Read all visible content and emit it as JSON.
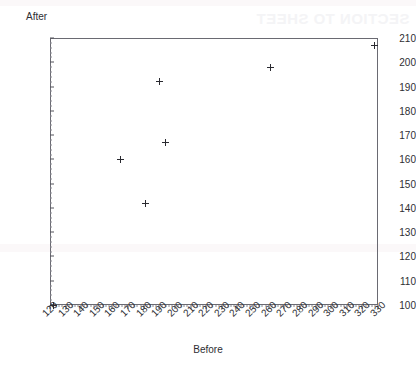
{
  "artifact": {
    "watermark_text": "SECTION TO SHEET"
  },
  "chart_data": {
    "type": "scatter",
    "title": "",
    "xlabel": "Before",
    "ylabel": "After",
    "xlim": [
      120,
      330
    ],
    "ylim": [
      100,
      210
    ],
    "x_tick_step": 10,
    "y_tick_step": 10,
    "grid": false,
    "legend": null,
    "marker": "plus",
    "marker_color": "#2a2a30",
    "x_ticks": [
      120,
      130,
      140,
      150,
      160,
      170,
      180,
      190,
      200,
      210,
      220,
      230,
      240,
      250,
      260,
      270,
      280,
      290,
      300,
      310,
      320,
      330
    ],
    "y_ticks": [
      100,
      110,
      120,
      130,
      140,
      150,
      160,
      170,
      180,
      190,
      200,
      210
    ],
    "points": [
      {
        "x": 122,
        "y": 100
      },
      {
        "x": 165,
        "y": 160
      },
      {
        "x": 181,
        "y": 142
      },
      {
        "x": 190,
        "y": 192
      },
      {
        "x": 194,
        "y": 167
      },
      {
        "x": 261,
        "y": 198
      },
      {
        "x": 328,
        "y": 207
      }
    ]
  }
}
